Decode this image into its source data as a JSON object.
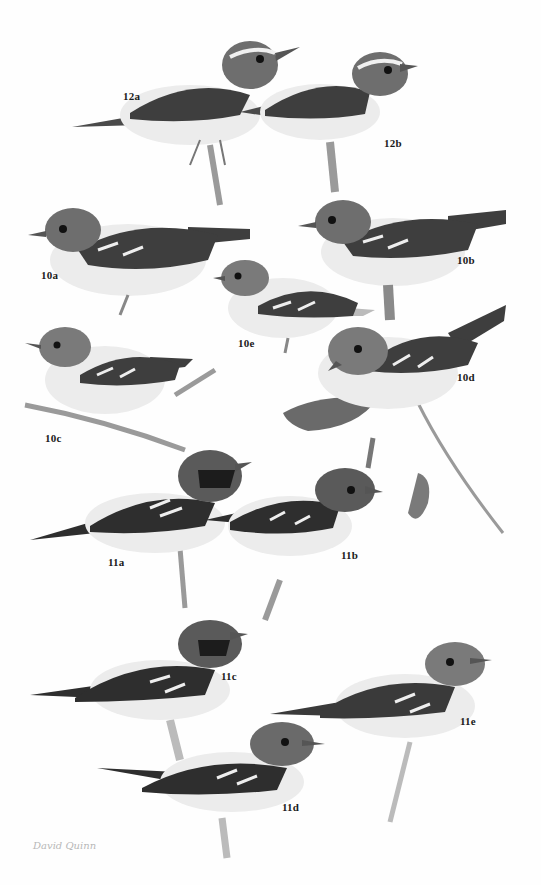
{
  "plate": {
    "background": "#fefefe",
    "palette": {
      "back": "#6e6e6e",
      "wing": "#3e3e3e",
      "belly": "#ececec",
      "cap": "#5a5a5a",
      "mask": "#1c1c1c",
      "branch": "#9a9a9a",
      "leaf": "#6a6a6a"
    },
    "figures": [
      {
        "id": "12a",
        "label": "12a"
      },
      {
        "id": "12b",
        "label": "12b"
      },
      {
        "id": "10a",
        "label": "10a"
      },
      {
        "id": "10b",
        "label": "10b"
      },
      {
        "id": "10e",
        "label": "10e"
      },
      {
        "id": "10c",
        "label": "10c"
      },
      {
        "id": "10d",
        "label": "10d"
      },
      {
        "id": "11a",
        "label": "11a"
      },
      {
        "id": "11b",
        "label": "11b"
      },
      {
        "id": "11c",
        "label": "11c"
      },
      {
        "id": "11e",
        "label": "11e"
      },
      {
        "id": "11d",
        "label": "11d"
      }
    ],
    "signature": "David Quinn"
  }
}
